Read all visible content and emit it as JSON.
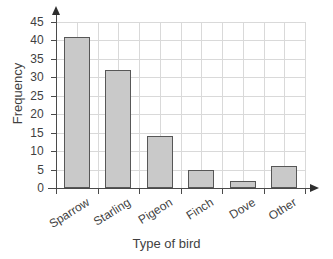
{
  "chart_data": {
    "type": "bar",
    "title": "",
    "categories": [
      "Sparrow",
      "Starling",
      "Pigeon",
      "Finch",
      "Dove",
      "Other"
    ],
    "values": [
      41,
      32,
      14,
      5,
      2,
      6
    ],
    "xlabel": "Type of bird",
    "ylabel": "Frequency",
    "ylim": [
      0,
      45
    ],
    "ytick_step": 5,
    "yticks": [
      0,
      5,
      10,
      15,
      20,
      25,
      30,
      35,
      40,
      45
    ],
    "ytick_labels": [
      "0",
      "5",
      "10",
      "15",
      "20",
      "25",
      "30",
      "35",
      "40",
      "45"
    ],
    "grid": true,
    "legend": false,
    "bar_fill_color": "#c9c9c9",
    "bar_edge_color": "#575757",
    "grid_color": "#d9d9d9",
    "axis_color": "#4a4a4a",
    "background_color": "#ffffff",
    "axis_arrows": true,
    "xtick_label_rotation": -32
  }
}
